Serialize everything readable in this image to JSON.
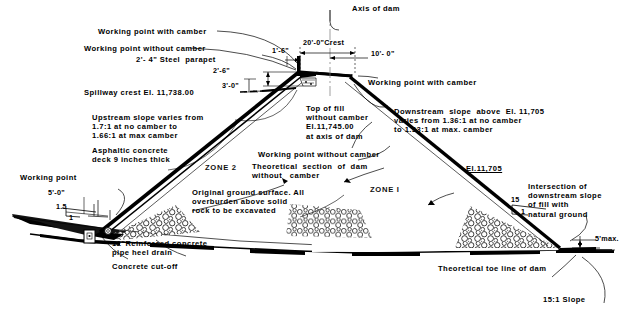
{
  "drawing": {
    "title": "Typical cross section of dam",
    "type": "engineering-cross-section"
  },
  "annotations": {
    "axis_of_dam": "Axis of dam",
    "working_point_with_camber_top": "Working point with camber",
    "working_point_without_camber_top": "Working point without camber",
    "steel_parapet": "2'- 4\" Steel  parapet",
    "spillway_crest": "Spillway crest El. 11,738.00",
    "upstream_slope": "Upstream slope varies from\n1.7:1 at no camber to\n1.66:1 at max camber",
    "asphaltic_concrete": "Asphaltic concrete\ndeck 9 inches thick",
    "working_point_left": "Working point",
    "pipe_heel_drain": "12\"Reinforced concrete\npipe heel drain",
    "concrete_cutoff": "Concrete cut-off",
    "original_ground": "Original ground surface. All\noverburden above solid\nrock to be excavated",
    "top_of_fill": "Top of fill\nwithout camber\nEl.11,745.00\nat axis of dam",
    "working_point_without_camber_mid": "Working point without camber",
    "theoretical_section": "Theoretical  section  of  dam\nwithout   camber",
    "working_point_with_camber_right": "Working point with camber",
    "downstream_slope": "Downstream  slope  above  El. 11,705\nvaries from 1.36:1 at no camber\nto 1.33:1 at max. camber",
    "el_11705": "El.11,705",
    "intersection_note": "Intersection of\ndownstream slope\nof fill with\nnatural ground",
    "theoretical_toe": "Theoretical toe line of dam",
    "slope_15_1": "15:1 Slope",
    "five_max": "5'max.",
    "zone_1": "ZONE I",
    "zone_2": "ZONE 2"
  },
  "dimensions": {
    "crest_width": "20'-0\"Crest",
    "offset_10ft": "10'- 0\"",
    "one_six": "1'-6\"",
    "two_six": "2'-6\"",
    "three_zero": "3'-0\"",
    "five_zero": "5'-0\"",
    "slope_ratio_left_rise": "1.5",
    "slope_ratio_left_run": "1",
    "slope_ratio_right_rise": "15",
    "slope_ratio_right_run": "1"
  },
  "elevations": {
    "spillway_crest_el": "11,738.00",
    "top_of_fill_el": "11,745.00",
    "downstream_break_el": "11,705"
  },
  "colors": {
    "ink": "#000000",
    "paper": "#ffffff",
    "hairline": "#333333"
  }
}
